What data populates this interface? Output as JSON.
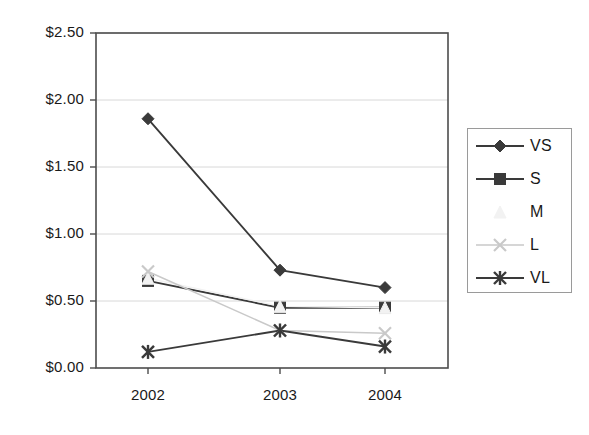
{
  "chart_data": {
    "type": "line",
    "title": "",
    "xlabel": "",
    "ylabel": "",
    "categories": [
      "2002",
      "2003",
      "2004"
    ],
    "x_tick_labels": [
      "2002",
      "2003",
      "2004"
    ],
    "y_tick_labels": [
      "$0.00",
      "$0.50",
      "$1.00",
      "$1.50",
      "$2.00",
      "$2.50"
    ],
    "y_tick_values": [
      0.0,
      0.5,
      1.0,
      1.5,
      2.0,
      2.5
    ],
    "ylim": [
      0.0,
      2.5
    ],
    "grid": "horizontal",
    "legend_position": "right",
    "series": [
      {
        "name": "VS",
        "marker": "diamond",
        "color": "#3a3a3a",
        "values": [
          1.86,
          0.73,
          0.6
        ]
      },
      {
        "name": "S",
        "marker": "square",
        "color": "#3a3a3a",
        "values": [
          0.65,
          0.45,
          0.45
        ]
      },
      {
        "name": "M",
        "marker": "triangle",
        "color": "#f2f2f2",
        "values": [
          0.67,
          0.46,
          0.45
        ]
      },
      {
        "name": "L",
        "marker": "x",
        "color": "#c9c9c9",
        "values": [
          0.72,
          0.28,
          0.26
        ]
      },
      {
        "name": "VL",
        "marker": "asterisk",
        "color": "#3a3a3a",
        "values": [
          0.12,
          0.28,
          0.16
        ]
      }
    ]
  },
  "legend": {
    "items": [
      {
        "label": "VS"
      },
      {
        "label": "S"
      },
      {
        "label": "M"
      },
      {
        "label": "L"
      },
      {
        "label": "VL"
      }
    ]
  },
  "colors": {
    "axis": "#4d4d4d",
    "grid": "#d8d8d8",
    "text": "#1a1a1a",
    "background": "#ffffff"
  }
}
